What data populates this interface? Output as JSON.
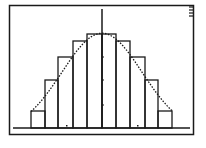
{
  "screen": {
    "type": "graphing-calculator-plot",
    "background": "#ffffff",
    "ink": "#1a1a1a"
  },
  "chart_data": {
    "type": "bar",
    "title": "",
    "xlabel": "",
    "ylabel": "",
    "grid": false,
    "legend": "none",
    "categories": [
      "1",
      "2",
      "3",
      "4",
      "5",
      "6",
      "7",
      "8",
      "9",
      "10"
    ],
    "bar_edges_px": [
      31,
      45,
      58,
      73,
      87,
      102,
      116,
      130,
      145,
      158,
      172
    ],
    "bar_tops_px": [
      111,
      80,
      57,
      41,
      34,
      34,
      41,
      57,
      80,
      111
    ],
    "values_relative": [
      0.18,
      0.51,
      0.75,
      0.91,
      1.0,
      1.0,
      0.91,
      0.75,
      0.51,
      0.18
    ],
    "series": [
      {
        "name": "histogram",
        "values": [
          0.18,
          0.51,
          0.75,
          0.91,
          1.0,
          1.0,
          0.91,
          0.75,
          0.51,
          0.18
        ]
      },
      {
        "name": "curve",
        "style": "dotted",
        "shape": "bell"
      }
    ],
    "axes": {
      "x_axis_y_px": 128,
      "y_axis_x_px": 102,
      "y_ticks_px": [
        57,
        80,
        105
      ],
      "x_ticks_px": [
        66,
        137
      ]
    }
  }
}
